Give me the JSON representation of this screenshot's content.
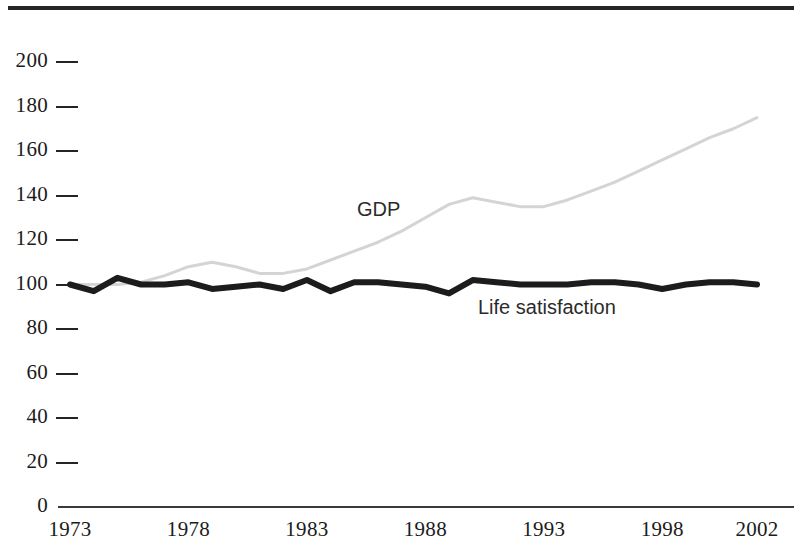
{
  "figure": {
    "width": 802,
    "height": 547,
    "background": "#ffffff",
    "top_rule_color": "#262626"
  },
  "axis": {
    "y_labels": [
      "200",
      "180",
      "160",
      "140",
      "120",
      "100",
      "80",
      "60",
      "40",
      "20",
      "0"
    ],
    "x_labels": [
      "1973",
      "1978",
      "1983",
      "1988",
      "1993",
      "1998",
      "2002"
    ],
    "tick_color": "#242424",
    "axis_line_color": "#3a3a3a"
  },
  "labels": {
    "gdp": "GDP",
    "life_satisfaction": "Life satisfaction"
  },
  "chart_data": {
    "type": "line",
    "title": "",
    "subtitle": "",
    "xlabel": "",
    "ylabel": "",
    "xlim": [
      1973,
      2002
    ],
    "ylim": [
      0,
      200
    ],
    "y_ticks": [
      0,
      20,
      40,
      60,
      80,
      100,
      120,
      140,
      160,
      180,
      200
    ],
    "x_ticks": [
      1973,
      1978,
      1983,
      1988,
      1993,
      1998,
      2002
    ],
    "grid": false,
    "legend": "inline-annotations",
    "annotations": [
      {
        "text": "GDP",
        "x": 1985,
        "y": 128
      },
      {
        "text": "Life satisfaction",
        "x": 1990,
        "y": 88
      }
    ],
    "x": [
      1973,
      1974,
      1975,
      1976,
      1977,
      1978,
      1979,
      1980,
      1981,
      1982,
      1983,
      1984,
      1985,
      1986,
      1987,
      1988,
      1989,
      1990,
      1991,
      1992,
      1993,
      1994,
      1995,
      1996,
      1997,
      1998,
      1999,
      2000,
      2001,
      2002
    ],
    "series": [
      {
        "name": "GDP",
        "color": "#d4d4d4",
        "line_width": 3,
        "values": [
          100,
          100,
          100,
          101,
          104,
          108,
          110,
          108,
          105,
          105,
          107,
          111,
          115,
          119,
          124,
          130,
          136,
          139,
          137,
          135,
          135,
          138,
          142,
          146,
          151,
          156,
          161,
          166,
          170,
          175
        ]
      },
      {
        "name": "Life satisfaction",
        "color": "#1c1c1c",
        "line_width": 6,
        "values": [
          100,
          97,
          103,
          100,
          100,
          101,
          98,
          99,
          100,
          98,
          102,
          97,
          101,
          101,
          100,
          99,
          96,
          102,
          101,
          100,
          100,
          100,
          101,
          101,
          100,
          98,
          100,
          101,
          101,
          100
        ]
      }
    ]
  }
}
